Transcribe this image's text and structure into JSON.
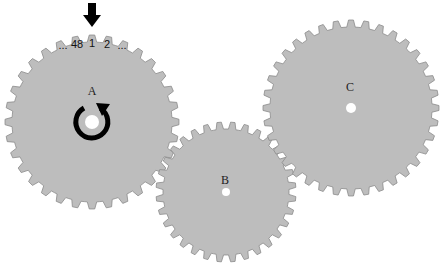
{
  "diagram": {
    "colors": {
      "gear_fill": "#bdbdbd",
      "gear_stroke": "#8a8a8a",
      "background": "#ffffff",
      "hole": "#ffffff",
      "ink": "#000000"
    },
    "gears": [
      {
        "id": "A",
        "label": "A",
        "cx": 92,
        "cy": 122,
        "outer_r": 87,
        "inner_r": 80,
        "teeth": 32,
        "hole_r": 7,
        "label_dy": -32,
        "rotation": 0
      },
      {
        "id": "B",
        "label": "B",
        "cx": 226,
        "cy": 192,
        "outer_r": 70,
        "inner_r": 63,
        "teeth": 32,
        "hole_r": 4,
        "label_dy": -10,
        "rotation": 5.6
      },
      {
        "id": "C",
        "label": "C",
        "cx": 351,
        "cy": 108,
        "outer_r": 88,
        "inner_r": 81,
        "teeth": 36,
        "hole_r": 5,
        "label_dy": -20,
        "rotation": 0
      }
    ],
    "tooth_numbering": {
      "gear": "A",
      "labels": [
        "...",
        "48",
        "1",
        "2",
        "..."
      ]
    },
    "pointer_arrow": {
      "direction": "down",
      "points_to": "A tooth 1"
    },
    "rotation_indicator": {
      "gear": "A",
      "direction": "clockwise"
    }
  }
}
